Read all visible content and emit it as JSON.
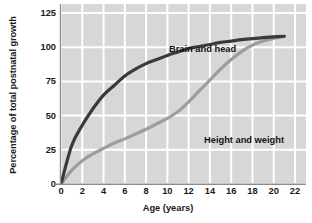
{
  "chart_data": {
    "type": "line",
    "title": "",
    "xlabel": "Age (years)",
    "ylabel": "Percentage of total postnatal growth",
    "xlim": [
      -1,
      23
    ],
    "ylim": [
      -5,
      130
    ],
    "xticks": [
      "0",
      "2",
      "4",
      "6",
      "8",
      "10",
      "12",
      "14",
      "16",
      "18",
      "20",
      "22"
    ],
    "yticks": [
      "0",
      "25",
      "50",
      "75",
      "100",
      "125"
    ],
    "grid": true,
    "legend_position": "inline-annotation",
    "background_color": "#d7d7d7",
    "gridline_color": "#ffffff",
    "x": [
      0,
      1,
      2,
      3,
      4,
      5,
      6,
      7,
      8,
      9,
      10,
      11,
      12,
      13,
      14,
      15,
      16,
      17,
      18,
      19,
      20,
      21
    ],
    "series": [
      {
        "name": "Brain and head",
        "color": "#3a3a3a",
        "values": [
          0,
          28,
          43,
          55,
          65,
          72,
          79,
          84,
          88,
          91,
          94,
          96.5,
          99,
          100.5,
          102,
          103.5,
          104.5,
          105.5,
          106.3,
          107,
          107.5,
          108
        ]
      },
      {
        "name": "Height and weight",
        "color": "#9d9d9d",
        "values": [
          0,
          10,
          17,
          22,
          26,
          30,
          33,
          36.5,
          40,
          44,
          48,
          53,
          60,
          68,
          76,
          84,
          91,
          97,
          101.5,
          104.5,
          106.5,
          108
        ]
      }
    ],
    "annotations": [
      {
        "text": "Brain and head",
        "x_px": 108,
        "y_px": 40
      },
      {
        "text": "Height and weight",
        "x_px": 143,
        "y_px": 131
      }
    ]
  }
}
